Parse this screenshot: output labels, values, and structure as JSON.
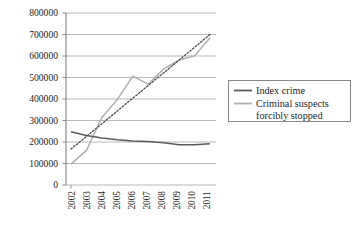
{
  "chart_data": {
    "type": "line",
    "title": "",
    "xlabel": "",
    "ylabel": "",
    "categories": [
      "2002",
      "2003",
      "2004",
      "2005",
      "2006",
      "2007",
      "2008",
      "2009",
      "2010",
      "2011"
    ],
    "ylim": [
      0,
      800000
    ],
    "yticks": [
      "0",
      "100000",
      "200000",
      "300000",
      "400000",
      "500000",
      "600000",
      "700000",
      "800000"
    ],
    "ytick_values": [
      0,
      100000,
      200000,
      300000,
      400000,
      500000,
      600000,
      700000,
      800000
    ],
    "grid": "horizontal",
    "legend_position": "right",
    "series": [
      {
        "name": "Index crime",
        "style": "solid",
        "color": "#5a5a5a",
        "values": [
          248000,
          230000,
          219000,
          211000,
          205000,
          202000,
          196000,
          187000,
          187000,
          192000
        ]
      },
      {
        "name": "Criminal suspects forcibly stopped",
        "style": "solid",
        "color": "#b0b0b0",
        "values": [
          97000,
          161000,
          314000,
          398000,
          506000,
          469000,
          540000,
          581000,
          601000,
          685000
        ]
      },
      {
        "name": "trendline",
        "style": "dotted",
        "color": "#4a4a4a",
        "values": [
          167000,
          226000,
          285000,
          344000,
          404000,
          463000,
          522000,
          581000,
          641000,
          700000
        ]
      }
    ]
  },
  "legend": {
    "items": [
      {
        "label": "Index crime",
        "color": "#5a5a5a"
      },
      {
        "label": "Criminal suspects",
        "label2": "forcibly stopped",
        "color": "#b0b0b0"
      }
    ]
  }
}
